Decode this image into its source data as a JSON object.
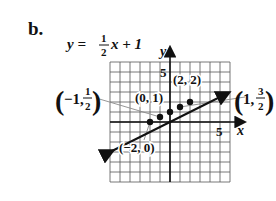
{
  "part_label": "b.",
  "equation": {
    "lhs": "y =",
    "num": "1",
    "den": "2",
    "rhs": "x + 1"
  },
  "axes": {
    "x_label": "x",
    "y_label": "y",
    "x_tick_label": "5",
    "y_tick_label": "5"
  },
  "point_labels": {
    "p_neg2_0": "(−2, 0)",
    "p_0_1": "(0, 1)",
    "p_2_2": "(2, 2)",
    "p_neg1_half": {
      "open": "(",
      "a": "−1,",
      "num": "1",
      "den": "2",
      "close": ")"
    },
    "p_1_3half": {
      "open": "(",
      "a": "1,",
      "num": "3",
      "den": "2",
      "close": ")"
    }
  },
  "colors": {
    "line": "#111111",
    "grid": "#555555",
    "leader": "#8a8a8a"
  },
  "chart_data": {
    "type": "line",
    "xlabel": "x",
    "ylabel": "y",
    "xlim": [
      -6,
      6
    ],
    "ylim": [
      -6,
      6
    ],
    "grid": true,
    "tick_labels": {
      "x": [
        "5"
      ],
      "y": [
        "5"
      ]
    },
    "series": [
      {
        "name": "y = 1/2 x + 1",
        "slope": 0.5,
        "intercept": 1,
        "x": [
          -6,
          6
        ],
        "y": [
          -2,
          4
        ],
        "arrows": "both"
      }
    ],
    "points": [
      {
        "x": -2,
        "y": 0,
        "label": "(−2, 0)"
      },
      {
        "x": -1,
        "y": 0.5,
        "label": "(−1, 1/2)"
      },
      {
        "x": 0,
        "y": 1,
        "label": "(0, 1)"
      },
      {
        "x": 1,
        "y": 1.5,
        "label": "(1, 3/2)"
      },
      {
        "x": 2,
        "y": 2,
        "label": "(2, 2)"
      }
    ]
  }
}
